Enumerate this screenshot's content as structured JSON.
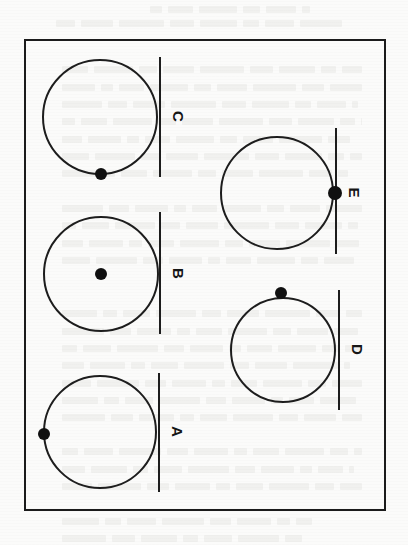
{
  "page": {
    "kind": "scanned-textbook-figure-page",
    "orientation_note": "rotated-90-clockwise",
    "background_color": "#fbfbfa",
    "ink_color": "#1d1d1d"
  },
  "figure": {
    "border_color": "#1b1b1b",
    "panels": [
      {
        "id": "A",
        "label": "A",
        "relation": "line-tangent-to-circle",
        "circle": {
          "cx": 100,
          "cy": 432,
          "r": 57
        },
        "line": {
          "x": 158,
          "y1": 373,
          "y2": 492
        },
        "dot": {
          "x": 44,
          "y": 434,
          "r": 6,
          "position": "leftmost-point-of-circle"
        }
      },
      {
        "id": "B",
        "label": "B",
        "relation": "line-tangent-to-circle",
        "circle": {
          "cx": 101,
          "cy": 274,
          "r": 58
        },
        "line": {
          "x": 159,
          "y1": 212,
          "y2": 334
        },
        "dot": {
          "x": 101,
          "y": 274,
          "r": 6,
          "position": "center-of-circle"
        }
      },
      {
        "id": "C",
        "label": "C",
        "relation": "line-tangent-to-circle",
        "circle": {
          "cx": 100,
          "cy": 117,
          "r": 58
        },
        "line": {
          "x": 159,
          "y1": 57,
          "y2": 177
        },
        "dot": {
          "x": 101,
          "y": 174,
          "r": 6,
          "position": "bottom-of-circle"
        }
      },
      {
        "id": "D",
        "label": "D",
        "relation": "line-tangent-to-circle",
        "circle": {
          "cx": 283,
          "cy": 350,
          "r": 53
        },
        "line": {
          "x": 338,
          "y1": 290,
          "y2": 410
        },
        "dot": {
          "x": 281,
          "y": 293,
          "r": 6,
          "position": "top-of-circle"
        }
      },
      {
        "id": "E",
        "label": "E",
        "relation": "line-through-circle-at-point",
        "circle": {
          "cx": 277,
          "cy": 193,
          "r": 57
        },
        "line": {
          "x": 335,
          "y1": 128,
          "y2": 254
        },
        "dot": {
          "x": 335,
          "y": 193,
          "r": 7,
          "position": "rightmost-point-of-circle-on-line"
        }
      }
    ]
  },
  "bleed_text_lines": [
    {
      "x": 150,
      "y": 6,
      "w": 160
    },
    {
      "x": 56,
      "y": 20,
      "w": 290
    },
    {
      "x": 62,
      "y": 66,
      "w": 300
    },
    {
      "x": 62,
      "y": 84,
      "w": 300
    },
    {
      "x": 62,
      "y": 101,
      "w": 296
    },
    {
      "x": 62,
      "y": 118,
      "w": 300
    },
    {
      "x": 62,
      "y": 136,
      "w": 292
    },
    {
      "x": 62,
      "y": 153,
      "w": 300
    },
    {
      "x": 62,
      "y": 170,
      "w": 286
    },
    {
      "x": 62,
      "y": 205,
      "w": 300
    },
    {
      "x": 62,
      "y": 222,
      "w": 296
    },
    {
      "x": 62,
      "y": 240,
      "w": 300
    },
    {
      "x": 62,
      "y": 257,
      "w": 292
    },
    {
      "x": 62,
      "y": 310,
      "w": 300
    },
    {
      "x": 62,
      "y": 328,
      "w": 296
    },
    {
      "x": 62,
      "y": 345,
      "w": 300
    },
    {
      "x": 62,
      "y": 362,
      "w": 288
    },
    {
      "x": 62,
      "y": 380,
      "w": 300
    },
    {
      "x": 62,
      "y": 397,
      "w": 294
    },
    {
      "x": 62,
      "y": 414,
      "w": 300
    },
    {
      "x": 62,
      "y": 448,
      "w": 300
    },
    {
      "x": 62,
      "y": 466,
      "w": 292
    },
    {
      "x": 62,
      "y": 483,
      "w": 300
    },
    {
      "x": 62,
      "y": 518,
      "w": 250
    },
    {
      "x": 62,
      "y": 535,
      "w": 240
    }
  ]
}
